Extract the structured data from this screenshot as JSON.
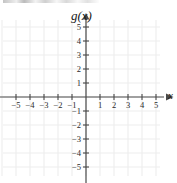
{
  "figure": {
    "y_axis_label": "g(x)",
    "x_axis_label": "x",
    "width": 177,
    "height": 183,
    "grid_color": "#ededed",
    "axis_color": "#4a4a4a",
    "text_color": "#2b2b2b",
    "background": "#ffffff"
  },
  "chart_data": {
    "type": "scatter",
    "title": "",
    "subtitle": "",
    "xlabel": "x",
    "ylabel": "g(x)",
    "xlim": [
      -6.1,
      6.4
    ],
    "ylim": [
      -6.1,
      5.9
    ],
    "xticks": [
      -5,
      -4,
      -3,
      -2,
      -1,
      1,
      2,
      3,
      4,
      5
    ],
    "yticks": [
      -5,
      -4,
      -3,
      -2,
      -1,
      1,
      2,
      3,
      4,
      5
    ],
    "xtick_labels": [
      "−5",
      "−4",
      "−3",
      "−2",
      "−1",
      "1",
      "2",
      "3",
      "4",
      "5"
    ],
    "ytick_labels": [
      "−5",
      "−4",
      "−3",
      "−2",
      "−1",
      "1",
      "2",
      "3",
      "4",
      "5"
    ],
    "grid": true,
    "grid_spacing": 1,
    "legend": null,
    "series": [],
    "x": [],
    "values": [],
    "annotations": []
  },
  "x_labels": [
    {
      "value": -5,
      "text": "−5"
    },
    {
      "value": -4,
      "text": "−4"
    },
    {
      "value": -3,
      "text": "−3"
    },
    {
      "value": -2,
      "text": "−2"
    },
    {
      "value": -1,
      "text": "−1"
    },
    {
      "value": 1,
      "text": "1"
    },
    {
      "value": 2,
      "text": "2"
    },
    {
      "value": 3,
      "text": "3"
    },
    {
      "value": 4,
      "text": "4"
    },
    {
      "value": 5,
      "text": "5"
    }
  ],
  "y_labels": [
    {
      "value": 5,
      "text": "5"
    },
    {
      "value": 4,
      "text": "4"
    },
    {
      "value": 3,
      "text": "3"
    },
    {
      "value": 2,
      "text": "2"
    },
    {
      "value": 1,
      "text": "1"
    },
    {
      "value": -1,
      "text": "−1"
    },
    {
      "value": -2,
      "text": "−2"
    },
    {
      "value": -3,
      "text": "−3"
    },
    {
      "value": -4,
      "text": "−4"
    },
    {
      "value": -5,
      "text": "−5"
    }
  ]
}
